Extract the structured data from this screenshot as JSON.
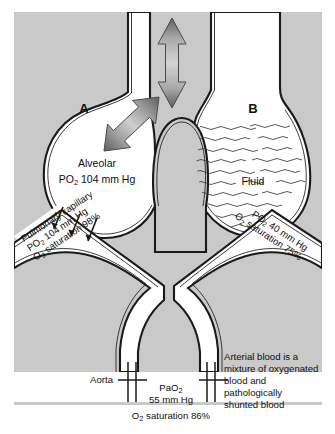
{
  "figure": {
    "panel": {
      "background_color": "#c9c9c9",
      "lumen_color": "#ffffff",
      "outline_color": "#1a1a1a"
    },
    "alveolus_a": {
      "letter": "A",
      "label_line1": "Alveolar",
      "label_line2_prefix": "P",
      "label_line2_sub": "O",
      "label_line2_sub2": "2",
      "label_line2_value": "104 mm Hg",
      "label_line2_full": "PO2 104 mm Hg"
    },
    "alveolus_b": {
      "letter": "B",
      "fluid_label": "Fluid"
    },
    "capillary_left": {
      "line1": "Pulmonary capillary",
      "line2_prefix": "P",
      "line2_sub": "O",
      "line2_sub2": "2",
      "line2_value": "104 mm Hg",
      "line2_full": "PO2 104 mm Hg",
      "line3_prefix": "O",
      "line3_sub": "2",
      "line3_value": "saturation 98%",
      "line3_full": "O2 saturation 98%"
    },
    "capillary_right": {
      "line1_prefix": "P",
      "line1_sub": "O",
      "line1_sub2": "2",
      "line1_value": "40 mm Hg",
      "line1_full": "PO2 40 mm Hg",
      "line2_prefix": "O",
      "line2_sub": "2",
      "line2_value": "saturation 75%",
      "line2_full": "O2 saturation 75%"
    },
    "aorta": {
      "label": "Aorta",
      "pao2_prefix": "PaO",
      "pao2_sub": "2",
      "pao2_full": "PaO2",
      "pao2_value": "55 mm Hg",
      "saturation_prefix": "O",
      "saturation_sub": "2",
      "saturation_value": "saturation 86%",
      "saturation_full": "O2 saturation 86%"
    },
    "annotation": {
      "line1": "Arterial blood is a",
      "line2": "mixture of oxygenated",
      "line3": "blood and",
      "line4": "pathologically",
      "line5": "shunted blood"
    },
    "arrows": {
      "vertical_airflow": "vertical-double-arrow",
      "diagonal_airflow": "diagonal-double-arrow",
      "gas_exchange": "gas-exchange-arrows"
    }
  }
}
